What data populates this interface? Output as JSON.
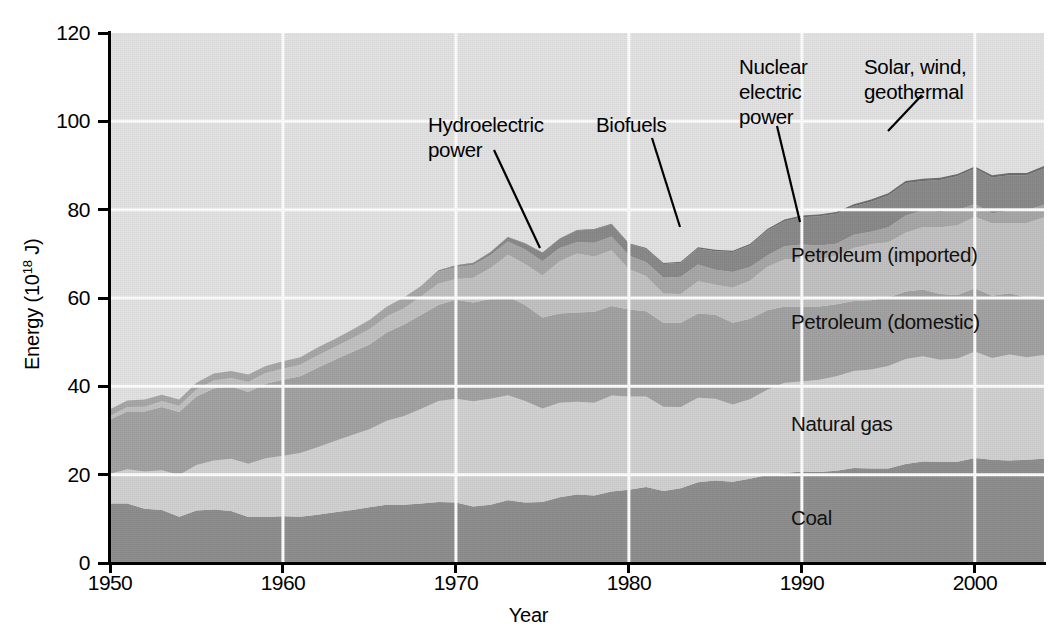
{
  "axes": {
    "y_title_prefix": "Energy (10",
    "y_title_sup": "18",
    "y_title_suffix": " J)",
    "x_title": "Year",
    "y_ticks": [
      "0",
      "20",
      "40",
      "60",
      "80",
      "100",
      "120"
    ],
    "x_ticks": [
      "1950",
      "1960",
      "1970",
      "1980",
      "1990",
      "2000"
    ]
  },
  "annotations": {
    "hydroelectric": "Hydroelectric\npower",
    "biofuels": "Biofuels",
    "nuclear": "Nuclear\nelectric\npower",
    "solar": "Solar, wind,\ngeothermal",
    "petroleum_imported": "Petroleum (imported)",
    "petroleum_domestic": "Petroleum (domestic)",
    "natural_gas": "Natural gas",
    "coal": "Coal"
  },
  "colors": {
    "plot_background": "#e3e3e3",
    "gridline": "#ffffff",
    "coal": "#8f8f8f",
    "natural_gas": "#d2d2d2",
    "petroleum_domestic": "#a3a3a3",
    "petroleum_imported": "#c2c2c2",
    "nuclear": "#8a8a8a",
    "hydroelectric": "#a8a8a8",
    "biofuels": "#757575",
    "solar": "#6e6e6e",
    "axis": "#000000"
  },
  "chart_data": {
    "type": "area",
    "stacked": true,
    "title": "",
    "xlabel": "Year",
    "ylabel": "Energy (10^18 J)",
    "xlim": [
      1950,
      2004
    ],
    "ylim": [
      0,
      120
    ],
    "grid": true,
    "legend_position": "inline-annotations",
    "x": [
      1950,
      1951,
      1952,
      1953,
      1954,
      1955,
      1956,
      1957,
      1958,
      1959,
      1960,
      1961,
      1962,
      1963,
      1964,
      1965,
      1966,
      1967,
      1968,
      1969,
      1970,
      1971,
      1972,
      1973,
      1974,
      1975,
      1976,
      1977,
      1978,
      1979,
      1980,
      1981,
      1982,
      1983,
      1984,
      1985,
      1986,
      1987,
      1988,
      1989,
      1990,
      1991,
      1992,
      1993,
      1994,
      1995,
      1996,
      1997,
      1998,
      1999,
      2000,
      2001,
      2002,
      2003,
      2004
    ],
    "series": [
      {
        "name": "Coal",
        "values": [
          13.5,
          13.5,
          12.3,
          12.0,
          10.5,
          11.9,
          12.1,
          11.8,
          10.4,
          10.4,
          10.6,
          10.5,
          10.9,
          11.5,
          12.0,
          12.6,
          13.2,
          13.2,
          13.5,
          13.8,
          13.7,
          12.8,
          13.2,
          14.2,
          13.7,
          13.8,
          14.9,
          15.5,
          15.3,
          16.2,
          16.6,
          17.2,
          16.3,
          16.9,
          18.3,
          18.7,
          18.4,
          19.1,
          19.9,
          20.4,
          20.7,
          20.6,
          20.9,
          21.5,
          21.4,
          21.4,
          22.4,
          23.0,
          22.9,
          22.9,
          23.8,
          23.4,
          23.2,
          23.4,
          23.6
        ]
      },
      {
        "name": "Natural gas",
        "values": [
          6.7,
          7.7,
          8.4,
          9.0,
          9.4,
          10.3,
          11.1,
          11.8,
          12.1,
          13.3,
          13.7,
          14.4,
          15.3,
          16.1,
          17.0,
          17.7,
          19.0,
          20.1,
          21.4,
          22.9,
          23.5,
          23.8,
          24.0,
          23.8,
          23.0,
          21.2,
          21.4,
          21.0,
          21.0,
          21.7,
          21.1,
          20.5,
          19.1,
          18.4,
          19.1,
          18.5,
          17.5,
          18.0,
          19.3,
          20.4,
          20.4,
          20.9,
          21.4,
          22.0,
          22.4,
          23.2,
          23.8,
          23.8,
          23.1,
          23.4,
          24.1,
          23.0,
          24.0,
          23.2,
          23.5
        ]
      },
      {
        "name": "Petroleum (domestic)",
        "values": [
          12.3,
          13.1,
          13.6,
          14.3,
          14.3,
          15.5,
          16.3,
          16.4,
          16.2,
          16.9,
          17.2,
          17.4,
          18.0,
          18.4,
          18.8,
          19.2,
          20.0,
          20.7,
          21.3,
          21.8,
          22.4,
          22.4,
          22.6,
          22.3,
          21.7,
          20.6,
          20.2,
          20.2,
          20.6,
          20.3,
          19.7,
          19.3,
          19.0,
          19.1,
          19.1,
          19.0,
          18.5,
          18.2,
          18.0,
          17.3,
          16.9,
          16.6,
          16.3,
          15.8,
          15.7,
          15.5,
          15.3,
          15.1,
          14.9,
          14.4,
          14.3,
          14.1,
          13.9,
          13.5,
          13.4
        ]
      },
      {
        "name": "Petroleum (imported)",
        "values": [
          0.8,
          1.0,
          1.1,
          1.3,
          1.4,
          1.6,
          1.8,
          1.9,
          2.3,
          2.4,
          2.5,
          2.6,
          2.8,
          2.9,
          3.1,
          3.4,
          3.6,
          3.7,
          4.2,
          4.8,
          4.7,
          5.6,
          7.0,
          9.5,
          9.3,
          9.5,
          11.8,
          13.4,
          12.5,
          12.6,
          9.1,
          8.0,
          6.6,
          6.5,
          7.3,
          6.8,
          8.0,
          8.6,
          9.9,
          10.6,
          11.0,
          10.6,
          11.0,
          12.0,
          12.7,
          12.5,
          13.3,
          14.2,
          15.1,
          15.8,
          16.2,
          16.4,
          15.9,
          16.9,
          17.8
        ]
      },
      {
        "name": "Hydroelectric power",
        "values": [
          1.5,
          1.5,
          1.6,
          1.5,
          1.4,
          1.5,
          1.6,
          1.6,
          1.7,
          1.6,
          1.7,
          1.7,
          1.8,
          1.8,
          1.9,
          2.1,
          2.1,
          2.3,
          2.3,
          2.7,
          2.7,
          2.9,
          2.9,
          3.0,
          3.3,
          3.2,
          3.0,
          2.5,
          3.1,
          3.1,
          3.1,
          3.1,
          3.6,
          3.9,
          3.8,
          3.4,
          3.5,
          3.1,
          2.5,
          3.0,
          3.1,
          3.2,
          2.7,
          3.0,
          2.8,
          3.4,
          3.9,
          3.7,
          3.5,
          3.4,
          2.9,
          2.3,
          2.7,
          2.9,
          2.8
        ]
      },
      {
        "name": "Nuclear electric power",
        "values": [
          0.0,
          0.0,
          0.0,
          0.0,
          0.0,
          0.0,
          0.0,
          0.0,
          0.0,
          0.0,
          0.0,
          0.0,
          0.0,
          0.0,
          0.0,
          0.0,
          0.1,
          0.1,
          0.1,
          0.2,
          0.3,
          0.4,
          0.6,
          0.9,
          1.3,
          1.9,
          2.1,
          2.7,
          3.0,
          2.8,
          2.7,
          3.0,
          3.1,
          3.2,
          3.6,
          4.2,
          4.5,
          4.9,
          5.7,
          5.7,
          6.2,
          6.6,
          6.8,
          6.5,
          6.8,
          7.2,
          7.3,
          6.7,
          7.2,
          7.7,
          8.0,
          8.1,
          8.1,
          7.9,
          8.2
        ]
      },
      {
        "name": "Solar, wind, geothermal",
        "values": [
          0.0,
          0.0,
          0.0,
          0.0,
          0.0,
          0.0,
          0.0,
          0.0,
          0.0,
          0.0,
          0.0,
          0.0,
          0.0,
          0.0,
          0.0,
          0.0,
          0.0,
          0.0,
          0.0,
          0.1,
          0.1,
          0.1,
          0.1,
          0.1,
          0.1,
          0.1,
          0.1,
          0.1,
          0.1,
          0.1,
          0.1,
          0.2,
          0.2,
          0.2,
          0.3,
          0.3,
          0.3,
          0.3,
          0.3,
          0.4,
          0.4,
          0.4,
          0.4,
          0.4,
          0.5,
          0.5,
          0.5,
          0.5,
          0.5,
          0.5,
          0.5,
          0.5,
          0.5,
          0.5,
          0.6
        ]
      }
    ]
  }
}
